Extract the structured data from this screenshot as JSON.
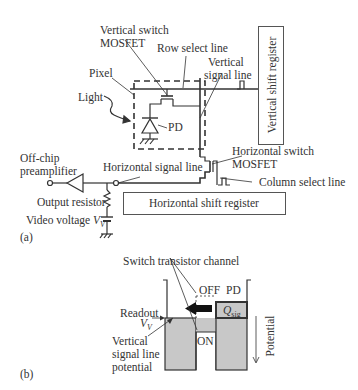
{
  "figure_a": {
    "panel_label": "(a)",
    "labels": {
      "vertical_switch": [
        "Vertical switch",
        "MOSFET"
      ],
      "row_select_line": "Row select line",
      "vertical_signal_line": [
        "Vertical",
        "signal line"
      ],
      "pixel": "Pixel",
      "light": "Light",
      "pd": "PD",
      "off_chip_preamp": [
        "Off-chip",
        "preamplifier"
      ],
      "horizontal_signal_line": "Horizontal signal line",
      "horizontal_switch": [
        "Horizontal switch",
        "MOSFET"
      ],
      "column_select_line": "Column select line",
      "output_resistor": "Output resistor",
      "video_voltage": "Video voltage",
      "video_voltage_symbol": "V",
      "video_voltage_sub": "V"
    },
    "blocks": {
      "vertical_shift_register": "Vertical shift register",
      "horizontal_shift_register": "Horizontal shift register"
    }
  },
  "figure_b": {
    "panel_label": "(b)",
    "labels": {
      "switch_channel": "Switch transistor channel",
      "off": "OFF",
      "on": "ON",
      "pd": "PD",
      "q_sig": "Q",
      "q_sig_sub": "sig",
      "readout": "Readout",
      "vv_symbol": "V",
      "vv_sub": "V",
      "vsl_potential": [
        "Vertical",
        "signal line",
        "potential"
      ],
      "potential_axis": "Potential"
    },
    "colors": {
      "well_fill": "#c8c8c8",
      "stroke": "#333333"
    }
  }
}
